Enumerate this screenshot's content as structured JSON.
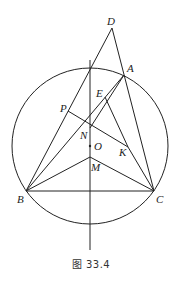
{
  "figure": {
    "caption": "图 33.4",
    "circle": {
      "center": "O",
      "cx": 90,
      "cy": 146,
      "r": 78
    },
    "points": {
      "D": {
        "x": 112,
        "y": 28,
        "label": "D",
        "lx": 107,
        "ly": 25
      },
      "A": {
        "x": 124,
        "y": 75,
        "label": "A",
        "lx": 127,
        "ly": 72
      },
      "B": {
        "x": 26,
        "y": 191,
        "label": "B",
        "lx": 17,
        "ly": 203
      },
      "C": {
        "x": 154,
        "y": 191,
        "label": "C",
        "lx": 156,
        "ly": 203
      },
      "E": {
        "x": 105,
        "y": 97,
        "label": "E",
        "lx": 96,
        "ly": 97
      },
      "P": {
        "x": 68,
        "y": 111,
        "label": "P",
        "lx": 60,
        "ly": 112
      },
      "N": {
        "x": 90,
        "y": 128,
        "label": "N",
        "lx": 80,
        "ly": 139
      },
      "O": {
        "x": 90,
        "y": 146,
        "label": "O",
        "lx": 94,
        "ly": 150
      },
      "M": {
        "x": 90,
        "y": 157,
        "label": "M",
        "lx": 91,
        "ly": 171
      },
      "K": {
        "x": 128,
        "y": 147,
        "label": "K",
        "lx": 119,
        "ly": 156
      },
      "L1": {
        "x": 90,
        "y": 60
      },
      "L2": {
        "x": 90,
        "y": 250
      }
    },
    "segments": [
      [
        "D",
        "B"
      ],
      [
        "D",
        "C"
      ],
      [
        "A",
        "B"
      ],
      [
        "A",
        "N"
      ],
      [
        "B",
        "C"
      ],
      [
        "B",
        "M"
      ],
      [
        "M",
        "C"
      ],
      [
        "P",
        "K"
      ],
      [
        "E",
        "K"
      ],
      [
        "K",
        "C"
      ],
      [
        "L1",
        "L2"
      ]
    ],
    "colors": {
      "stroke": "#222222",
      "background": "#ffffff"
    }
  }
}
